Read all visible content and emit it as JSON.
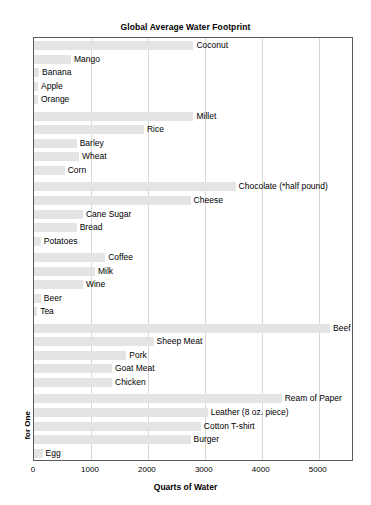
{
  "chart_data": {
    "type": "bar",
    "orientation": "horizontal",
    "title": "Global Average Water Footprint",
    "xlabel": "Quarts of Water",
    "ylabel": "",
    "xlim": [
      0,
      5620
    ],
    "xticks": [
      0,
      1000,
      2000,
      3000,
      4000,
      5000
    ],
    "xtick_labels": [
      "0",
      "1000",
      "2000",
      "3000",
      "4000",
      "5000"
    ],
    "grid": true,
    "legend": "none",
    "bar_color": "#e4e4e4",
    "groups": [
      {
        "label": "for One Fruit",
        "categories": [
          "Coconut",
          "Mango",
          "Banana",
          "Apple",
          "Orange"
        ],
        "values": [
          2800,
          650,
          90,
          70,
          70
        ]
      },
      {
        "label": "for One Pound",
        "categories": [
          "Millet",
          "Rice",
          "Barley",
          "Wheat",
          "Corn"
        ],
        "values": [
          2800,
          1930,
          750,
          790,
          540
        ]
      },
      {
        "label": "for One Pound*",
        "categories": [
          "Chocolate (*half pound)",
          "Cheese",
          "Cane Sugar",
          "Bread",
          "Potatoes"
        ],
        "values": [
          3540,
          2750,
          860,
          750,
          120
        ]
      },
      {
        "label": "for One Quart",
        "categories": [
          "Coffee",
          "Milk",
          "Wine",
          "Beer",
          "Tea"
        ],
        "values": [
          1250,
          1070,
          860,
          120,
          55
        ]
      },
      {
        "label": "for One Steak",
        "categories": [
          "Beef",
          "Sheep Meat",
          "Pork",
          "Goat Meat",
          "Chicken"
        ],
        "values": [
          5200,
          2100,
          1620,
          1370,
          1370
        ]
      },
      {
        "label": "for One",
        "categories": [
          "Ream of Paper",
          "Leather (8 oz. piece)",
          "Cotton T-shirt",
          "Burger",
          "Egg"
        ],
        "values": [
          4350,
          3050,
          2930,
          2750,
          150
        ]
      }
    ]
  }
}
